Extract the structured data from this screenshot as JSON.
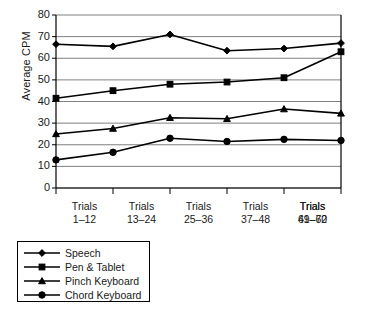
{
  "chart_data": {
    "type": "line",
    "title": "",
    "xlabel": "",
    "ylabel": "Average CPM",
    "ylim": [
      0,
      80
    ],
    "ytick_step": 10,
    "yticks": [
      "80",
      "70",
      "60",
      "50",
      "40",
      "30",
      "20",
      "10",
      "0"
    ],
    "grid": true,
    "legend_position": "below-left",
    "categories": [
      "Trials\n1–12",
      "Trials\n13–24",
      "Trials\n25–36",
      "Trials\n37–48",
      "Trials\n49–60",
      "Trials\n61–72"
    ],
    "category_lines": [
      {
        "top": "Trials",
        "bottom": "1–12"
      },
      {
        "top": "Trials",
        "bottom": "13–24"
      },
      {
        "top": "Trials",
        "bottom": "25–36"
      },
      {
        "top": "Trials",
        "bottom": "37–48"
      },
      {
        "top": "Trials",
        "bottom": "49–60"
      },
      {
        "top": "Trials",
        "bottom": "61–72"
      }
    ],
    "series": [
      {
        "name": "Speech",
        "marker": "diamond",
        "values": [
          66.5,
          65.5,
          71.0,
          63.5,
          64.5,
          67.0
        ]
      },
      {
        "name": "Pen & Tablet",
        "marker": "square",
        "values": [
          41.5,
          45.0,
          48.0,
          49.0,
          51.0,
          63.0
        ]
      },
      {
        "name": "Pinch Keyboard",
        "marker": "triangle",
        "values": [
          25.0,
          27.5,
          32.5,
          32.0,
          36.5,
          34.5
        ]
      },
      {
        "name": "Chord Keyboard",
        "marker": "circle",
        "values": [
          13.0,
          16.5,
          23.0,
          21.5,
          22.5,
          22.0
        ]
      }
    ],
    "colors": {
      "line": "#000000",
      "marker": "#000000",
      "grid": "#808080",
      "frame": "#000000",
      "background": "#ffffff"
    }
  },
  "legend": {
    "items": [
      {
        "label": "Speech",
        "marker": "diamond-marker"
      },
      {
        "label": "Pen & Tablet",
        "marker": "square-marker"
      },
      {
        "label": "Pinch Keyboard",
        "marker": "triangle-marker"
      },
      {
        "label": "Chord Keyboard",
        "marker": "circle-marker"
      }
    ]
  }
}
